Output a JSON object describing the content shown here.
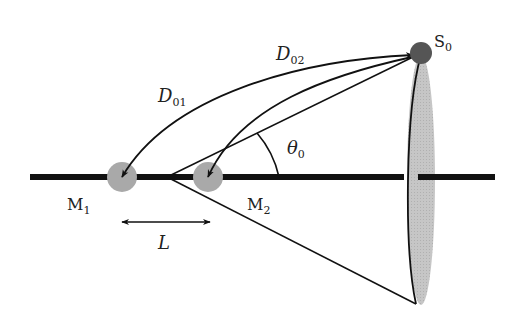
{
  "diagram": {
    "labels": {
      "source": "S",
      "source_sub": "0",
      "mic1": "M",
      "mic1_sub": "1",
      "mic2": "M",
      "mic2_sub": "2",
      "d01": "D",
      "d01_sub": "01",
      "d02": "D",
      "d02_sub": "02",
      "theta": "θ",
      "theta_sub": "0",
      "spacing": "L"
    },
    "colors": {
      "axis": "#111111",
      "mic_fill": "#a8a8a8",
      "source_fill": "#555555",
      "cone_fill": "#c8c8c8",
      "line": "#111111"
    }
  }
}
